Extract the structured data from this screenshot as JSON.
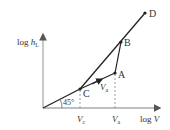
{
  "diagram": {
    "type": "log-log line diagram",
    "axes": {
      "x_label_prefix": "log ",
      "x_label_var": "V",
      "y_label_prefix": "log ",
      "y_label_var": "h",
      "y_label_sub": "L"
    },
    "angle_label": "45°",
    "points": {
      "C": "C",
      "A": "A",
      "B": "B",
      "D": "D"
    },
    "segment_label_var": "V",
    "segment_label_sub": "a",
    "ticks": {
      "vc_var": "V",
      "vc_sub": "c",
      "va_var": "V",
      "va_sub": "a"
    },
    "colors": {
      "line": "#222222",
      "axis": "#999999",
      "text": "#333333",
      "dashed": "#888888"
    }
  }
}
